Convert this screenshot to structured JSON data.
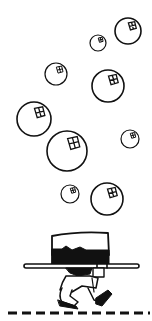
{
  "scene": {
    "background": "#ffffff",
    "ink": "#111111",
    "bubbles": [
      {
        "cx": 98,
        "cy": 43,
        "r": 8
      },
      {
        "cx": 128,
        "cy": 31,
        "r": 13
      },
      {
        "cx": 56,
        "cy": 74,
        "r": 11
      },
      {
        "cx": 108,
        "cy": 86,
        "r": 16
      },
      {
        "cx": 34,
        "cy": 119,
        "r": 17
      },
      {
        "cx": 67,
        "cy": 151,
        "r": 20
      },
      {
        "cx": 130,
        "cy": 139,
        "r": 9
      },
      {
        "cx": 70,
        "cy": 194,
        "r": 9
      },
      {
        "cx": 107,
        "cy": 199,
        "r": 16
      }
    ],
    "character": "walking-hat-character",
    "ground": "dashed-line"
  }
}
